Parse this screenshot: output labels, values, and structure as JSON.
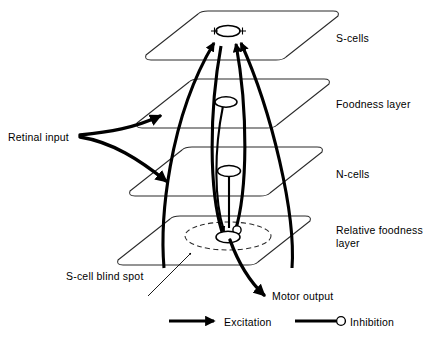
{
  "figure": {
    "type": "neural-network-layer-diagram",
    "background_color": "#ffffff",
    "ink_color": "#000000"
  },
  "layers": [
    {
      "id": "s-cells",
      "label": "S-cells",
      "order": 1
    },
    {
      "id": "foodness",
      "label": "Foodness layer",
      "order": 2
    },
    {
      "id": "n-cells",
      "label": "N-cells",
      "order": 3
    },
    {
      "id": "relative-foodness",
      "label": "Relative foodness layer",
      "order": 4
    }
  ],
  "annotations": {
    "retinal_input": "Retinal input",
    "blind_spot": "S-cell blind spot",
    "motor_output": "Motor output",
    "s_cell_plus_left": "+",
    "s_cell_plus_right": "+"
  },
  "legend": {
    "items": [
      {
        "id": "excitation",
        "label": "Excitation",
        "marker": "arrowhead"
      },
      {
        "id": "inhibition",
        "label": "Inhibition",
        "marker": "open-circle"
      }
    ]
  },
  "nodes": [
    {
      "id": "s-cell-node",
      "layer": "s-cells",
      "shape": "ellipse"
    },
    {
      "id": "foodness-node",
      "layer": "foodness",
      "shape": "ellipse"
    },
    {
      "id": "n-cell-node",
      "layer": "n-cells",
      "shape": "ellipse"
    },
    {
      "id": "relative-foodness-node",
      "layer": "relative-foodness",
      "shape": "ellipse"
    }
  ]
}
